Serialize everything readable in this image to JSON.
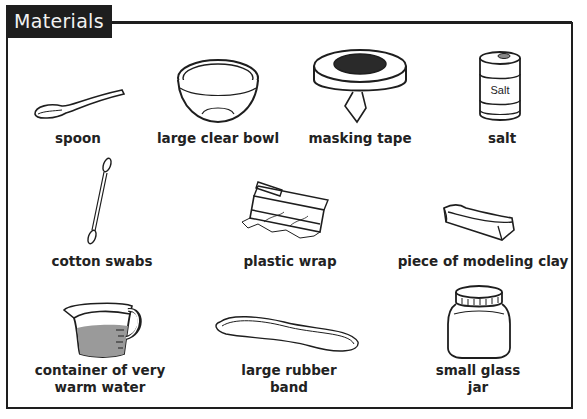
{
  "header": {
    "title": "Materials"
  },
  "items": [
    {
      "id": "spoon",
      "label": "spoon",
      "icon": "spoon-icon"
    },
    {
      "id": "bowl",
      "label": "large clear bowl",
      "icon": "bowl-icon"
    },
    {
      "id": "tape",
      "label": "masking tape",
      "icon": "masking-tape-icon"
    },
    {
      "id": "salt",
      "label": "salt",
      "icon": "salt-can-icon",
      "can_text": "Salt"
    },
    {
      "id": "swabs",
      "label": "cotton swabs",
      "icon": "cotton-swab-icon"
    },
    {
      "id": "wrap",
      "label": "plastic wrap",
      "icon": "plastic-wrap-icon"
    },
    {
      "id": "clay",
      "label": "piece of modeling clay",
      "icon": "clay-icon"
    },
    {
      "id": "water",
      "label_line1": "container of very",
      "label_line2": "warm water",
      "icon": "measuring-cup-icon"
    },
    {
      "id": "band",
      "label_line1": "large rubber",
      "label_line2": "band",
      "icon": "rubber-band-icon"
    },
    {
      "id": "jar",
      "label_line1": "small glass",
      "label_line2": "jar",
      "icon": "glass-jar-icon"
    }
  ],
  "colors": {
    "ink": "#1e1e1e",
    "tab_bg": "#1e1e1e",
    "tab_text": "#f2f2f2",
    "water_fill": "#9a9a9a",
    "tape_hole": "#2a2a2a"
  }
}
